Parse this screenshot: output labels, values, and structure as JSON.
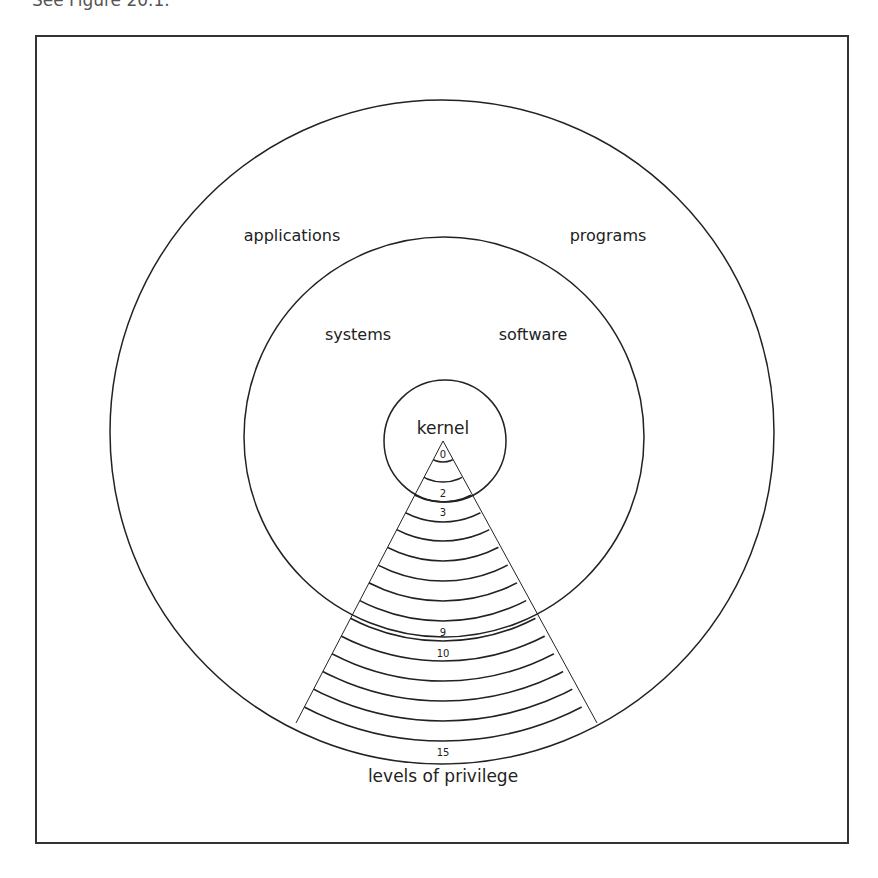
{
  "caption": "See Figure 20.1.",
  "diagram": {
    "rings": [
      {
        "name": "outer",
        "labels": [
          "applications",
          "programs"
        ]
      },
      {
        "name": "middle",
        "labels": [
          "systems",
          "software"
        ]
      },
      {
        "name": "core",
        "labels": [
          "kernel"
        ]
      }
    ],
    "labels": {
      "applications": "applications",
      "programs": "programs",
      "systems": "systems",
      "software": "software",
      "kernel": "kernel",
      "axis": "levels of privilege"
    },
    "level_labels": {
      "l0": "0",
      "l2": "2",
      "l3": "3",
      "l9": "9",
      "l10": "10",
      "l15": "15"
    },
    "levels_count": 16,
    "colors": {
      "stroke": "#222222",
      "frame": "#333333",
      "background": "#ffffff"
    }
  }
}
